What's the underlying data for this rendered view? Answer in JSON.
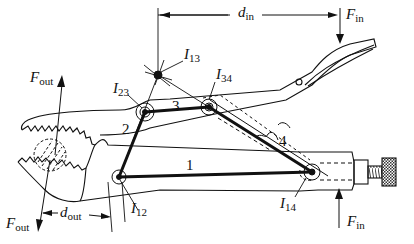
{
  "figure": {
    "colors": {
      "ink": "#111111",
      "background": "#ffffff"
    }
  },
  "forces": {
    "F_in_top": {
      "symbol": "F",
      "subscript": "in"
    },
    "F_in_bottom": {
      "symbol": "F",
      "subscript": "in"
    },
    "F_out_top": {
      "symbol": "F",
      "subscript": "out"
    },
    "F_out_bottom": {
      "symbol": "F",
      "subscript": "out"
    }
  },
  "dimensions": {
    "d_in": {
      "symbol": "d",
      "subscript": "in"
    },
    "d_out": {
      "symbol": "d",
      "subscript": "out"
    }
  },
  "instant_centers": [
    {
      "id": "I13",
      "symbol": "I",
      "subscript": "13"
    },
    {
      "id": "I23",
      "symbol": "I",
      "subscript": "23"
    },
    {
      "id": "I34",
      "symbol": "I",
      "subscript": "34"
    },
    {
      "id": "I12",
      "symbol": "I",
      "subscript": "12"
    },
    {
      "id": "I14",
      "symbol": "I",
      "subscript": "14"
    }
  ],
  "links": [
    {
      "number": "1"
    },
    {
      "number": "2"
    },
    {
      "number": "3"
    },
    {
      "number": "4"
    }
  ]
}
